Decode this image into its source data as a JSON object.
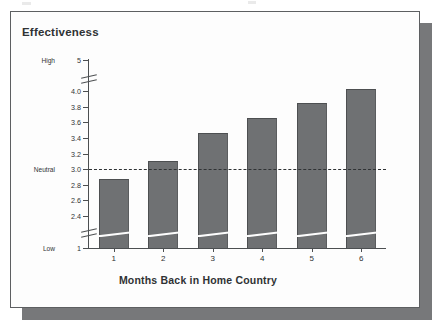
{
  "figure": {
    "title": "Effectiveness",
    "x_axis_title": "Months Back in Home Country",
    "low_word": "Low",
    "high_word": "High",
    "neutral_word": "Neutral",
    "bar_color": "#6f7173",
    "bar_edge_color": "#4d4f51",
    "axis_color": "#4c4f51",
    "text_color": "#2f3234",
    "card_background": "#fdfdfd",
    "shadow_color": "#77787a"
  },
  "chart_data": {
    "type": "bar",
    "title": "Effectiveness",
    "xlabel": "Months Back in Home Country",
    "ylabel": "Effectiveness",
    "categories": [
      "1",
      "2",
      "3",
      "4",
      "5",
      "6"
    ],
    "values": [
      2.88,
      3.1,
      3.46,
      3.66,
      3.85,
      4.05
    ],
    "ylim": [
      1,
      5
    ],
    "ytick_labels": [
      "5",
      "4.0",
      "3.8",
      "3.6",
      "3.4",
      "3.2",
      "3.0",
      "2.8",
      "2.6",
      "2.4",
      "1"
    ],
    "ytick_values": [
      5,
      4.0,
      3.8,
      3.6,
      3.4,
      3.2,
      3.0,
      2.8,
      2.6,
      2.4,
      1
    ],
    "ytick_side_labels": {
      "5": "High",
      "3.0": "Neutral",
      "1": "Low"
    },
    "axis_breaks": [
      "between 5 and 4.0",
      "between 2.4 and 1"
    ],
    "reference_line": {
      "value": 3.0,
      "label": "Neutral",
      "style": "dashed"
    },
    "grid": false,
    "legend": null
  }
}
